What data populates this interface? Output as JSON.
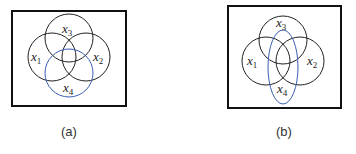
{
  "panels": [
    {
      "caption": "(a)",
      "frame": {
        "x": 12,
        "y": 11,
        "w": 114,
        "h": 95
      },
      "sets": [
        {
          "var": "x",
          "sub": "3",
          "shape": "circle",
          "cx": 69,
          "cy": 38,
          "r": 24,
          "color": "#222222",
          "label_x": 62,
          "label_y": 33
        },
        {
          "var": "x",
          "sub": "1",
          "shape": "circle",
          "cx": 52,
          "cy": 57,
          "r": 24,
          "color": "#222222",
          "label_x": 31,
          "label_y": 61
        },
        {
          "var": "x",
          "sub": "2",
          "shape": "circle",
          "cx": 86,
          "cy": 57,
          "r": 24,
          "color": "#222222",
          "label_x": 93,
          "label_y": 61
        },
        {
          "var": "x",
          "sub": "4",
          "shape": "circle",
          "cx": 69,
          "cy": 73,
          "r": 24,
          "color": "#3a5fb0",
          "label_x": 63,
          "label_y": 93
        }
      ]
    },
    {
      "caption": "(b)",
      "frame": {
        "x": 228,
        "y": 6,
        "w": 113,
        "h": 102
      },
      "sets": [
        {
          "var": "x",
          "sub": "3",
          "shape": "circle",
          "cx": 283,
          "cy": 40,
          "r": 24,
          "color": "#222222",
          "label_x": 276,
          "label_y": 28
        },
        {
          "var": "x",
          "sub": "1",
          "shape": "circle",
          "cx": 266,
          "cy": 61,
          "r": 24,
          "color": "#222222",
          "label_x": 246,
          "label_y": 66
        },
        {
          "var": "x",
          "sub": "2",
          "shape": "circle",
          "cx": 300,
          "cy": 61,
          "r": 24,
          "color": "#222222",
          "label_x": 307,
          "label_y": 66
        },
        {
          "var": "x",
          "sub": "4",
          "shape": "ellipse",
          "cx": 283,
          "cy": 67,
          "rx": 15,
          "ry": 37,
          "color": "#3a5fb0",
          "label_x": 277,
          "label_y": 94
        }
      ]
    }
  ]
}
